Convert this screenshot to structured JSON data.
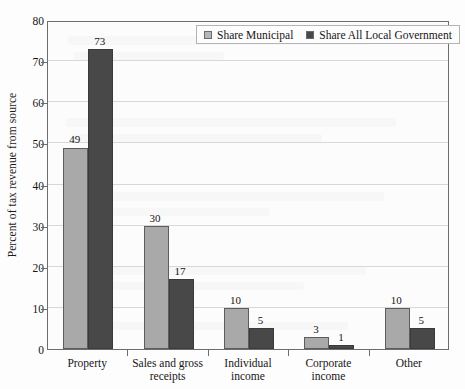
{
  "chart_data": {
    "type": "bar",
    "title": "",
    "xlabel": "",
    "ylabel": "Percent of tax revenue from source",
    "ylim": [
      0,
      80
    ],
    "yticks": [
      0,
      10,
      20,
      30,
      40,
      50,
      60,
      70,
      80
    ],
    "grid": true,
    "legend_position": "top-center",
    "categories": [
      "Property",
      "Sales and gross\nreceipts",
      "Individual\nincome",
      "Corporate\nincome",
      "Other"
    ],
    "series": [
      {
        "name": "Share Municipal",
        "color": "#a9a9a9",
        "values": [
          49,
          30,
          10,
          3,
          10
        ]
      },
      {
        "name": "Share All Local Government",
        "color": "#484848",
        "values": [
          73,
          17,
          5,
          1,
          5
        ]
      }
    ]
  }
}
